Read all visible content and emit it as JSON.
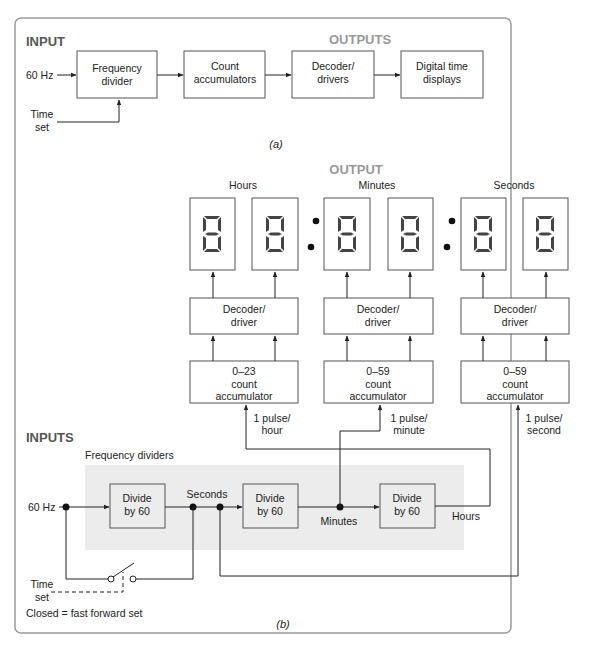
{
  "part_a": {
    "input_label": "INPUT",
    "outputs_label": "OUTPUTS",
    "signal_in": "60 Hz",
    "time_set": [
      "Time",
      "set"
    ],
    "blocks": [
      {
        "lines": [
          "Frequency",
          "divider"
        ]
      },
      {
        "lines": [
          "Count",
          "accumulators"
        ]
      },
      {
        "lines": [
          "Decoder/",
          "drivers"
        ]
      },
      {
        "lines": [
          "Digital time",
          "displays"
        ]
      }
    ],
    "caption_open": "(",
    "caption_letter": "a",
    "caption_close": ")"
  },
  "part_b": {
    "output_label": "OUTPUT",
    "inputs_label": "INPUTS",
    "display_groups": [
      {
        "label": "Hours"
      },
      {
        "label": "Minutes"
      },
      {
        "label": "Seconds"
      }
    ],
    "decoder": [
      "Decoder/",
      "driver"
    ],
    "accumulators": [
      {
        "range": "0–23",
        "lines": [
          "count",
          "accumulator"
        ],
        "pulse": [
          "1 pulse/",
          "hour"
        ]
      },
      {
        "range": "0–59",
        "lines": [
          "count",
          "accumulator"
        ],
        "pulse": [
          "1 pulse/",
          "minute"
        ]
      },
      {
        "range": "0–59",
        "lines": [
          "count",
          "accumulator"
        ],
        "pulse": [
          "1 pulse/",
          "second"
        ]
      }
    ],
    "freq_dividers_label": "Frequency dividers",
    "signal_in": "60 Hz",
    "dividers": [
      {
        "lines": [
          "Divide",
          "by 60"
        ]
      },
      {
        "lines": [
          "Divide",
          "by 60"
        ]
      },
      {
        "lines": [
          "Divide",
          "by 60"
        ]
      }
    ],
    "node_labels": {
      "seconds": "Seconds",
      "minutes": "Minutes",
      "hours": "Hours"
    },
    "time_set": [
      "Time",
      "set"
    ],
    "switch_note": "Closed = fast forward set",
    "caption_open": "(",
    "caption_letter": "b",
    "caption_close": ")"
  },
  "colors": {
    "frame": "#9a9a9a",
    "shade": "#ececec",
    "header_gray": "#999999",
    "segment": "#444444"
  }
}
